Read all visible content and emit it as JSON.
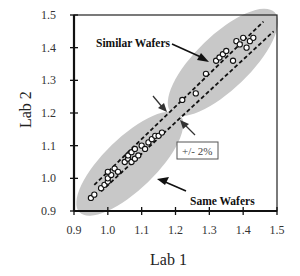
{
  "chart_data": {
    "type": "scatter",
    "title": "",
    "xlabel": "Lab 1",
    "ylabel": "Lab 2",
    "xlim": [
      0.9,
      1.5
    ],
    "ylim": [
      0.9,
      1.5
    ],
    "grid": false,
    "legend": null,
    "x_ticks": [
      "0.9",
      "1.0",
      "1.1",
      "1.2",
      "1.3",
      "1.4",
      "1.5"
    ],
    "y_ticks": [
      "0.9",
      "1.0",
      "1.1",
      "1.2",
      "1.3",
      "1.4",
      "1.5"
    ],
    "series": [
      {
        "name": "Same Wafers",
        "marker": "open-circle",
        "points": [
          [
            0.95,
            0.94
          ],
          [
            0.96,
            0.95
          ],
          [
            0.98,
            0.97
          ],
          [
            0.99,
            0.98
          ],
          [
            1.0,
            0.99
          ],
          [
            1.0,
            1.0
          ],
          [
            1.01,
            1.01
          ],
          [
            1.0,
            1.02
          ],
          [
            1.02,
            1.03
          ],
          [
            1.03,
            1.02
          ],
          [
            1.05,
            1.05
          ],
          [
            1.06,
            1.06
          ],
          [
            1.07,
            1.05
          ],
          [
            1.06,
            1.07
          ],
          [
            1.08,
            1.06
          ],
          [
            1.07,
            1.08
          ],
          [
            1.08,
            1.09
          ],
          [
            1.09,
            1.07
          ],
          [
            1.1,
            1.1
          ],
          [
            1.11,
            1.09
          ],
          [
            1.12,
            1.11
          ],
          [
            1.13,
            1.12
          ],
          [
            1.14,
            1.13
          ],
          [
            1.15,
            1.13
          ],
          [
            1.16,
            1.14
          ]
        ]
      },
      {
        "name": "Similar Wafers",
        "marker": "open-circle",
        "points": [
          [
            1.22,
            1.24
          ],
          [
            1.26,
            1.26
          ],
          [
            1.29,
            1.32
          ],
          [
            1.32,
            1.36
          ],
          [
            1.33,
            1.37
          ],
          [
            1.34,
            1.38
          ],
          [
            1.35,
            1.39
          ],
          [
            1.37,
            1.36
          ],
          [
            1.38,
            1.42
          ],
          [
            1.39,
            1.41
          ],
          [
            1.4,
            1.43
          ],
          [
            1.41,
            1.4
          ],
          [
            1.42,
            1.42
          ],
          [
            1.43,
            1.43
          ]
        ]
      }
    ],
    "reference_lines": [
      {
        "name": "upper-bound",
        "style": "dashed",
        "from": [
          0.96,
          0.98
        ],
        "to": [
          1.46,
          1.48
        ],
        "label": "+/- 2%"
      },
      {
        "name": "lower-bound",
        "style": "dashed",
        "from": [
          0.98,
          0.96
        ],
        "to": [
          1.49,
          1.45
        ],
        "label": "+/- 2%"
      }
    ],
    "regions": [
      {
        "name": "same-wafers-region",
        "shape": "ellipse",
        "center": [
          1.065,
          1.045
        ],
        "fill": "#c8c8c8"
      },
      {
        "name": "similar-wafers-region",
        "shape": "ellipse",
        "center": [
          1.34,
          1.355
        ],
        "fill": "#c8c8c8"
      }
    ],
    "annotations": [
      {
        "text": "Similar Wafers",
        "position": [
          1.02,
          1.42
        ],
        "arrow_to": [
          1.26,
          1.33
        ]
      },
      {
        "text": "Same Wafers",
        "position": [
          1.33,
          0.94
        ],
        "arrow_to": [
          1.16,
          1.01
        ]
      },
      {
        "text": "+/- 2%",
        "position": [
          1.26,
          1.15
        ],
        "boxed": true
      }
    ]
  },
  "labels": {
    "xlabel": "Lab 1",
    "ylabel": "Lab 2",
    "similar_wafers": "Similar Wafers",
    "same_wafers": "Same Wafers",
    "tolerance": "+/- 2%"
  }
}
